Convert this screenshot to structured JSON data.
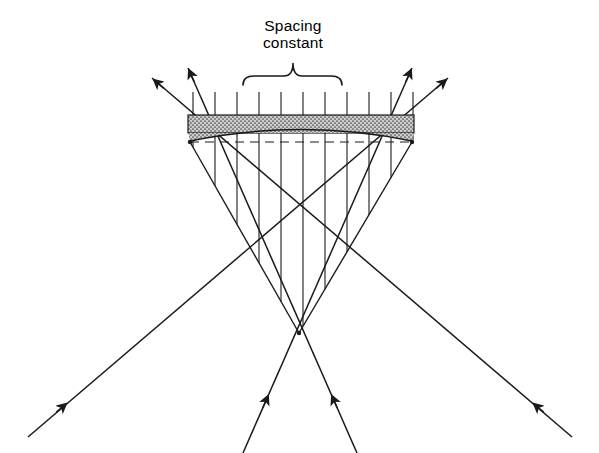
{
  "figure": {
    "title_label": "Spacing constant",
    "label_line_1": "Spacing",
    "label_line_2": "constant",
    "background_color": "#ffffff",
    "ink_color": "#1a1a1a",
    "band_fill_color": "#c9c9c9",
    "canvas": {
      "width": 599,
      "height": 453
    }
  },
  "annotation": {
    "brace": {
      "name": "spacing-constant-brace",
      "left_x": 243,
      "right_x": 342,
      "baseline_y": 76,
      "tip_x": 293,
      "tip_y": 63
    },
    "text_x": 293,
    "text_y_line1": 31,
    "text_y_line2": 48
  },
  "crystal_band": {
    "name": "stippled-crystal-band",
    "left_x": 188,
    "right_x": 414,
    "top_y": 115,
    "bottom_y": 133,
    "fill": "#c9c9c9",
    "stipple": true
  },
  "curved_arc": {
    "name": "curvature-arc",
    "start_x": 190,
    "start_y": 141,
    "control_x": 301,
    "control_y": 118,
    "end_x": 412,
    "end_y": 141
  },
  "dashed_axis": {
    "name": "dashed-center-axis",
    "x1": 190,
    "y1": 142,
    "x2": 412,
    "y2": 142,
    "dash": "9 6"
  },
  "nodes": [
    {
      "name": "left-focus-node",
      "x": 190,
      "y": 142
    },
    {
      "name": "right-focus-node",
      "x": 412,
      "y": 142
    },
    {
      "name": "bottom-focus-node",
      "x": 299,
      "y": 333
    }
  ],
  "vertical_rays": {
    "name": "vertical-ray-bundle",
    "count": 11,
    "first_x": 193,
    "spacing": 22,
    "top_y": 92,
    "apex_x": 299,
    "apex_y": 333,
    "left_edge_x": 190,
    "right_edge_x": 412,
    "edge_y": 142
  },
  "diagonal_rays": [
    {
      "name": "ray-lower-left-to-upper-right",
      "x1": 28,
      "y1": 437,
      "x2": 448,
      "y2": 78,
      "arrows": [
        {
          "name": "arrowhead-lower-left",
          "x": 66,
          "y": 404,
          "angle": -40.5
        },
        {
          "name": "arrowhead-upper-right",
          "x": 446,
          "y": 80,
          "angle": -40.5
        }
      ]
    },
    {
      "name": "ray-lower-right-to-upper-left",
      "x1": 572,
      "y1": 437,
      "x2": 152,
      "y2": 78,
      "arrows": [
        {
          "name": "arrowhead-lower-right",
          "x": 534,
          "y": 404,
          "angle": 220.5
        },
        {
          "name": "arrowhead-upper-left",
          "x": 154,
          "y": 80,
          "angle": 220.5
        }
      ]
    },
    {
      "name": "ray-bottom-left-to-upper-right-inner",
      "x1": 243,
      "y1": 453,
      "x2": 412,
      "y2": 68,
      "arrows": [
        {
          "name": "arrowhead-bottom-left-inner",
          "x": 268,
          "y": 396,
          "angle": -66.3
        },
        {
          "name": "arrowhead-upper-right-inner",
          "x": 411,
          "y": 70,
          "angle": -66.3
        }
      ]
    },
    {
      "name": "ray-bottom-right-to-upper-left-inner",
      "x1": 357,
      "y1": 453,
      "x2": 188,
      "y2": 68,
      "arrows": [
        {
          "name": "arrowhead-bottom-right-inner",
          "x": 332,
          "y": 396,
          "angle": 246.3
        },
        {
          "name": "arrowhead-upper-left-inner",
          "x": 189,
          "y": 70,
          "angle": 246.3
        }
      ]
    }
  ]
}
